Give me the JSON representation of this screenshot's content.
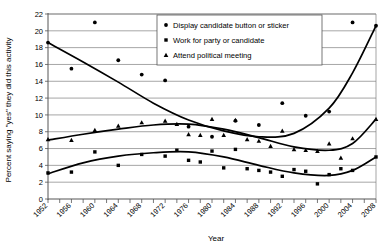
{
  "chart_data": {
    "type": "scatter",
    "title": "",
    "xlabel": "Year",
    "ylabel": "Percent saying \"yes\" they did this activity",
    "xlim": [
      1952,
      2008
    ],
    "ylim": [
      0,
      22
    ],
    "ytick_step": 2,
    "xtick_step": 2,
    "xtick_label_step": 4,
    "grid": "horizontal",
    "legend_position": "top-center",
    "yticks": [
      0,
      2,
      4,
      6,
      8,
      10,
      12,
      14,
      16,
      18,
      20,
      22
    ],
    "xticks": [
      1952,
      1954,
      1956,
      1958,
      1960,
      1962,
      1964,
      1966,
      1968,
      1970,
      1972,
      1974,
      1976,
      1978,
      1980,
      1982,
      1984,
      1986,
      1988,
      1990,
      1992,
      1994,
      1996,
      1998,
      2000,
      2002,
      2004,
      2006,
      2008
    ],
    "xtick_labels": [
      "1952",
      "1956",
      "1960",
      "1964",
      "1968",
      "1972",
      "1976",
      "1980",
      "1984",
      "1988",
      "1992",
      "1996",
      "2000",
      "2004",
      "2008"
    ],
    "series": [
      {
        "name": "Display candidate button or sticker",
        "marker": "circle",
        "color": "#000000",
        "x": [
          1952,
          1956,
          1960,
          1964,
          1968,
          1972,
          1976,
          1980,
          1984,
          1988,
          1992,
          1996,
          2000,
          2004,
          2008
        ],
        "values": [
          18.6,
          15.5,
          21.0,
          16.5,
          14.8,
          14.1,
          8.6,
          7.4,
          9.3,
          8.8,
          11.4,
          9.9,
          10.4,
          21.0,
          20.6
        ],
        "trend": {
          "type": "cubic-fit",
          "x": [
            1952,
            1958,
            1964,
            1970,
            1976,
            1982,
            1988,
            1994,
            2000,
            2004,
            2008
          ],
          "y": [
            18.6,
            16.3,
            13.9,
            11.4,
            9.4,
            8.1,
            7.4,
            7.8,
            10.8,
            15.0,
            20.6
          ]
        }
      },
      {
        "name": "Work for party or  candidate",
        "marker": "square",
        "color": "#000000",
        "x": [
          1952,
          1956,
          1960,
          1964,
          1968,
          1972,
          1974,
          1976,
          1978,
          1980,
          1982,
          1984,
          1986,
          1988,
          1990,
          1992,
          1994,
          1996,
          1998,
          2000,
          2002,
          2004,
          2008
        ],
        "values": [
          3.1,
          3.2,
          5.6,
          4.0,
          5.3,
          5.1,
          5.8,
          4.6,
          4.4,
          5.7,
          3.7,
          5.9,
          3.6,
          3.4,
          3.2,
          2.7,
          3.5,
          3.3,
          1.8,
          2.9,
          3.6,
          3.4,
          5.0
        ],
        "trend": {
          "type": "cubic-fit",
          "x": [
            1952,
            1958,
            1964,
            1970,
            1976,
            1982,
            1988,
            1994,
            2000,
            2004,
            2008
          ],
          "y": [
            3.0,
            4.3,
            5.1,
            5.5,
            5.6,
            5.0,
            4.0,
            3.1,
            2.8,
            3.4,
            5.0
          ]
        }
      },
      {
        "name": "Attend political meeting",
        "marker": "triangle",
        "color": "#000000",
        "x": [
          1952,
          1956,
          1960,
          1964,
          1968,
          1972,
          1974,
          1976,
          1978,
          1980,
          1982,
          1984,
          1986,
          1988,
          1990,
          1992,
          1994,
          1996,
          1998,
          2000,
          2002,
          2004,
          2008
        ],
        "values": [
          7.1,
          7.0,
          8.2,
          8.7,
          9.1,
          9.3,
          8.9,
          7.7,
          7.6,
          9.5,
          7.6,
          9.4,
          7.1,
          6.9,
          6.3,
          8.1,
          5.9,
          5.8,
          5.7,
          6.6,
          4.9,
          7.2,
          9.5
        ],
        "trend": {
          "type": "cubic-fit",
          "x": [
            1952,
            1958,
            1964,
            1970,
            1976,
            1982,
            1988,
            1994,
            2000,
            2004,
            2008
          ],
          "y": [
            7.0,
            7.7,
            8.3,
            8.8,
            8.9,
            8.3,
            7.3,
            6.2,
            5.8,
            6.6,
            9.5
          ]
        }
      }
    ]
  },
  "legend": {
    "items": [
      {
        "label": "Display candidate button or sticker",
        "marker": "circle"
      },
      {
        "label": "Work for party or  candidate",
        "marker": "square"
      },
      {
        "label": "Attend political meeting",
        "marker": "triangle"
      }
    ]
  },
  "axes": {
    "x_title": "Year",
    "y_title": "Percent saying \"yes\" they did this activity"
  }
}
